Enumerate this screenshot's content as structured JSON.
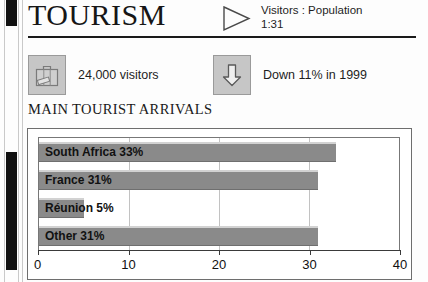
{
  "header": {
    "title": "TOURISM",
    "ratio_icon": "play-triangle-icon",
    "ratio_line1": "Visitors : Population",
    "ratio_line2": "1:31"
  },
  "stats": [
    {
      "icon": "suitcase-icon",
      "label": "24,000 visitors"
    },
    {
      "icon": "down-arrow-icon",
      "label": "Down 11% in 1999"
    }
  ],
  "section": {
    "heading": "MAIN TOURIST ARRIVALS"
  },
  "chart_data": {
    "type": "bar",
    "orientation": "horizontal",
    "title": "MAIN TOURIST ARRIVALS",
    "xlabel": "",
    "ylabel": "",
    "categories": [
      "South Africa",
      "France",
      "Réunion",
      "Other"
    ],
    "values": [
      33,
      31,
      5,
      31
    ],
    "bar_labels": [
      "South Africa 33%",
      "France 31%",
      "Réunion 5%",
      "Other 31%"
    ],
    "xlim": [
      0,
      40
    ],
    "xticks": [
      0,
      10,
      20,
      30,
      40
    ],
    "xtick_labels": [
      "0",
      "10",
      "20",
      "30",
      "40"
    ],
    "grid": true,
    "legend": false,
    "bar_color": "#8a8a8a",
    "plot_background": "#ffffff"
  }
}
